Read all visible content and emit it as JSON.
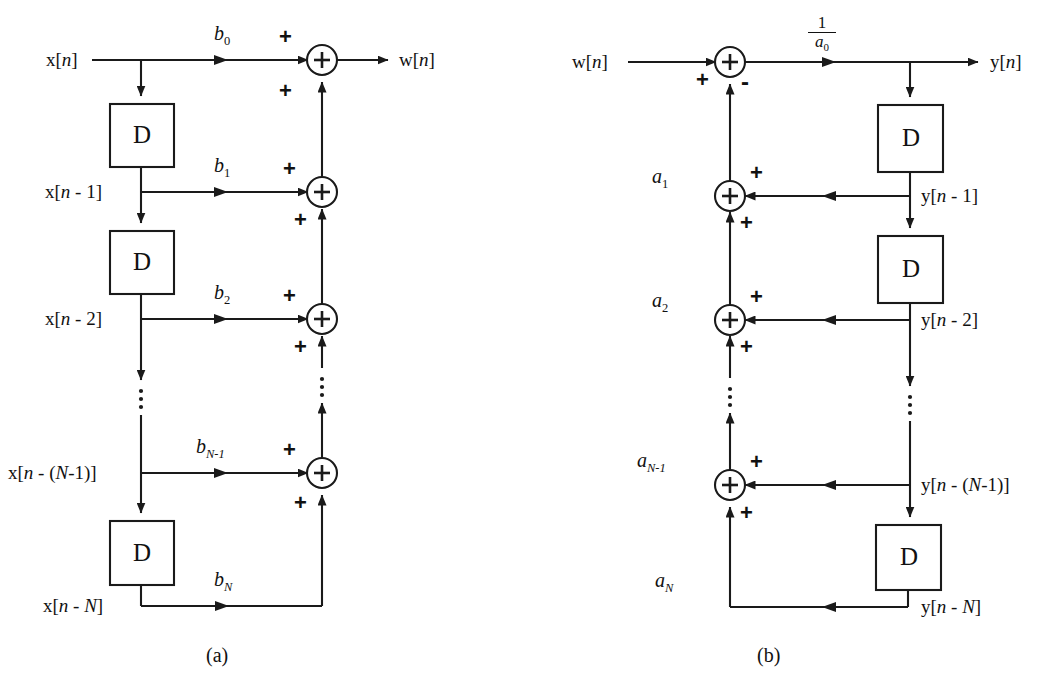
{
  "figure": {
    "type": "signal-flow-diagram",
    "subfigures": [
      {
        "caption": "(a)",
        "name": "feedforward-section",
        "input_label": "x[n]",
        "output_label": "w[n]",
        "delay_block_label": "D",
        "taps": [
          {
            "signal": "x[n]",
            "coefficient": "b",
            "coefficient_sub": "0",
            "sign_top": "+",
            "sign_bottom": "+"
          },
          {
            "signal": "x[n - 1]",
            "coefficient": "b",
            "coefficient_sub": "1",
            "sign_top": "+",
            "sign_bottom": "+"
          },
          {
            "signal": "x[n - 2]",
            "coefficient": "b",
            "coefficient_sub": "2",
            "sign_top": "+",
            "sign_bottom": "+"
          },
          {
            "signal": "x[n - (N-1)]",
            "coefficient": "b",
            "coefficient_sub": "N-1",
            "sign_top": "+",
            "sign_bottom": "+"
          },
          {
            "signal": "x[n - N]",
            "coefficient": "b",
            "coefficient_sub": "N",
            "sign_top": "",
            "sign_bottom": ""
          }
        ],
        "summer_symbol": "+",
        "ellipsis": "vertical-dots"
      },
      {
        "caption": "(b)",
        "name": "feedback-section",
        "input_label": "w[n]",
        "output_label": "y[n]",
        "delay_block_label": "D",
        "gain_numerator": "1",
        "gain_denominator": "a",
        "gain_denominator_sub": "0",
        "input_sign": "+",
        "feedback_sign": "-",
        "taps": [
          {
            "signal": "y[n - 1]",
            "coefficient": "a",
            "coefficient_sub": "1",
            "sign_top": "+",
            "sign_bottom": "+"
          },
          {
            "signal": "y[n - 2]",
            "coefficient": "a",
            "coefficient_sub": "2",
            "sign_top": "+",
            "sign_bottom": "+"
          },
          {
            "signal": "y[n - (N-1)]",
            "coefficient": "a",
            "coefficient_sub": "N-1",
            "sign_top": "+",
            "sign_bottom": "+"
          },
          {
            "signal": "y[n - N]",
            "coefficient": "a",
            "coefficient_sub": "N",
            "sign_top": "",
            "sign_bottom": ""
          }
        ],
        "summer_symbol": "+",
        "ellipsis": "vertical-dots"
      }
    ]
  },
  "colors": {
    "ink": "#1a1a1a",
    "background": "#ffffff"
  }
}
